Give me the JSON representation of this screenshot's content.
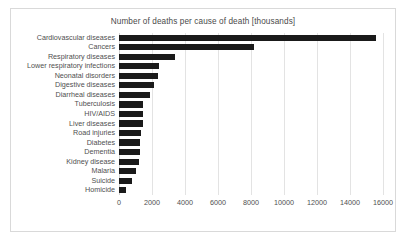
{
  "chart_data": {
    "type": "bar",
    "orientation": "horizontal",
    "title": "Number of deaths per cause of death [thousands]",
    "xlabel": "",
    "ylabel": "",
    "xlim": [
      0,
      16000
    ],
    "xticks": [
      "0",
      "2000",
      "4000",
      "6000",
      "8000",
      "10000",
      "12000",
      "14000",
      "16000"
    ],
    "grid": true,
    "legend": false,
    "bar_color": "#1a1a1a",
    "categories": [
      "Cardiovascular diseases",
      "Cancers",
      "Respiratory diseases",
      "Lower respiratory infections",
      "Neonatal disorders",
      "Digestive diseases",
      "Diarrheal diseases",
      "Tuberculosis",
      "HIV/AIDS",
      "Liver diseases",
      "Road injuries",
      "Diabetes",
      "Dementia",
      "Kidney disease",
      "Malaria",
      "Suicide",
      "Homicide"
    ],
    "values": [
      15600,
      8200,
      3400,
      2450,
      2350,
      2150,
      1850,
      1450,
      1450,
      1450,
      1350,
      1300,
      1250,
      1200,
      1000,
      800,
      400
    ]
  }
}
